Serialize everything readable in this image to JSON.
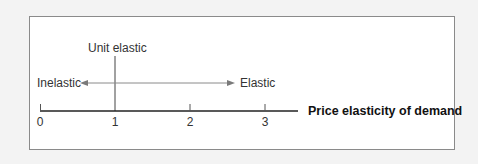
{
  "diagram": {
    "labels": {
      "unit": "Unit elastic",
      "inelastic": "Inelastic",
      "elastic": "Elastic",
      "axis_title": "Price elasticity of demand"
    },
    "ticks": [
      "0",
      "1",
      "2",
      "3"
    ],
    "colors": {
      "background": "#f3f3f3",
      "panel": "#ffffff",
      "border": "#8a8a8a",
      "axis": "#222222",
      "arrow": "#7a7a7a",
      "text": "#333333"
    }
  }
}
